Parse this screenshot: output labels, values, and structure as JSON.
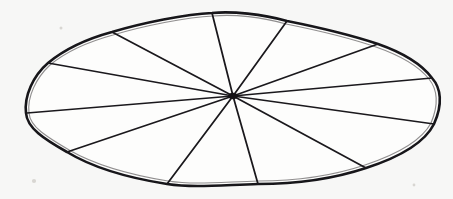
{
  "figure": {
    "description": "Hand-drawn irregular oval with a scalloped rim divided into twelve wedge-shaped sectors radiating from an off-centre hub.",
    "media": "ink line drawing",
    "canvas": {
      "width": 453,
      "height": 199
    },
    "background_color": "#f7f7f6",
    "ink_color": "#17161a",
    "fill_color": "#fdfdfc"
  },
  "diagram_data": {
    "type": "radial-sector",
    "sector_count": 12,
    "hub": {
      "x": 233,
      "y": 96
    },
    "outline_extent": {
      "left": 24,
      "right": 443,
      "top": 11,
      "bottom": 188
    },
    "outline_shape": "irregular scalloped ellipse",
    "rim_vertices": [
      {
        "id": "v1",
        "label": "top",
        "x": 212,
        "y": 13
      },
      {
        "id": "v2",
        "label": "upper-right",
        "x": 287,
        "y": 21
      },
      {
        "id": "v3",
        "label": "right-upper",
        "x": 378,
        "y": 44
      },
      {
        "id": "v4",
        "label": "right-upper-flank",
        "x": 432,
        "y": 78
      },
      {
        "id": "v5",
        "label": "right-lower-flank",
        "x": 434,
        "y": 124
      },
      {
        "id": "v6",
        "label": "lower-right",
        "x": 366,
        "y": 168
      },
      {
        "id": "v7",
        "label": "bottom-right",
        "x": 258,
        "y": 184
      },
      {
        "id": "v8",
        "label": "bottom-left",
        "x": 167,
        "y": 184
      },
      {
        "id": "v9",
        "label": "lower-left",
        "x": 67,
        "y": 152
      },
      {
        "id": "v10",
        "label": "left",
        "x": 27,
        "y": 113
      },
      {
        "id": "v11",
        "label": "upper-left-flank",
        "x": 48,
        "y": 63
      },
      {
        "id": "v12",
        "label": "upper-left",
        "x": 112,
        "y": 32
      }
    ],
    "spokes": [
      {
        "id": "s1",
        "to": "v1",
        "angle_deg": 100.6,
        "length_px": 85
      },
      {
        "id": "s2",
        "to": "v2",
        "angle_deg": 66.0,
        "length_px": 92
      },
      {
        "id": "s3",
        "to": "v3",
        "angle_deg": 17.7,
        "length_px": 152
      },
      {
        "id": "s4",
        "to": "v4",
        "angle_deg": 5.1,
        "length_px": 200
      },
      {
        "id": "s5",
        "to": "v5",
        "angle_deg": -8.3,
        "length_px": 203
      },
      {
        "id": "s6",
        "to": "v6",
        "angle_deg": -31.0,
        "length_px": 155
      },
      {
        "id": "s7",
        "to": "v7",
        "angle_deg": -74.3,
        "length_px": 91
      },
      {
        "id": "s8",
        "to": "v8",
        "angle_deg": -126.8,
        "length_px": 110
      },
      {
        "id": "s9",
        "to": "v9",
        "angle_deg": -163.3,
        "length_px": 173
      },
      {
        "id": "s10",
        "to": "v10",
        "angle_deg": 175.8,
        "length_px": 207
      },
      {
        "id": "s11",
        "to": "v11",
        "angle_deg": 170.9,
        "length_px": 188
      },
      {
        "id": "s12",
        "to": "v12",
        "angle_deg": 152.4,
        "length_px": 136
      }
    ],
    "sectors": [
      {
        "id": "w1",
        "between": [
          "v1",
          "v2"
        ],
        "position": "top"
      },
      {
        "id": "w2",
        "between": [
          "v2",
          "v3"
        ],
        "position": "upper-right"
      },
      {
        "id": "w3",
        "between": [
          "v3",
          "v4"
        ],
        "position": "right-upper"
      },
      {
        "id": "w4",
        "between": [
          "v4",
          "v5"
        ],
        "position": "right"
      },
      {
        "id": "w5",
        "between": [
          "v5",
          "v6"
        ],
        "position": "right-lower"
      },
      {
        "id": "w6",
        "between": [
          "v6",
          "v7"
        ],
        "position": "lower-right"
      },
      {
        "id": "w7",
        "between": [
          "v7",
          "v8"
        ],
        "position": "bottom"
      },
      {
        "id": "w8",
        "between": [
          "v8",
          "v9"
        ],
        "position": "lower-left"
      },
      {
        "id": "w9",
        "between": [
          "v9",
          "v10"
        ],
        "position": "left-lower"
      },
      {
        "id": "w10",
        "between": [
          "v10",
          "v11"
        ],
        "position": "left"
      },
      {
        "id": "w11",
        "between": [
          "v11",
          "v12"
        ],
        "position": "upper-left"
      },
      {
        "id": "w12",
        "between": [
          "v12",
          "v1"
        ],
        "position": "top-left"
      }
    ]
  }
}
